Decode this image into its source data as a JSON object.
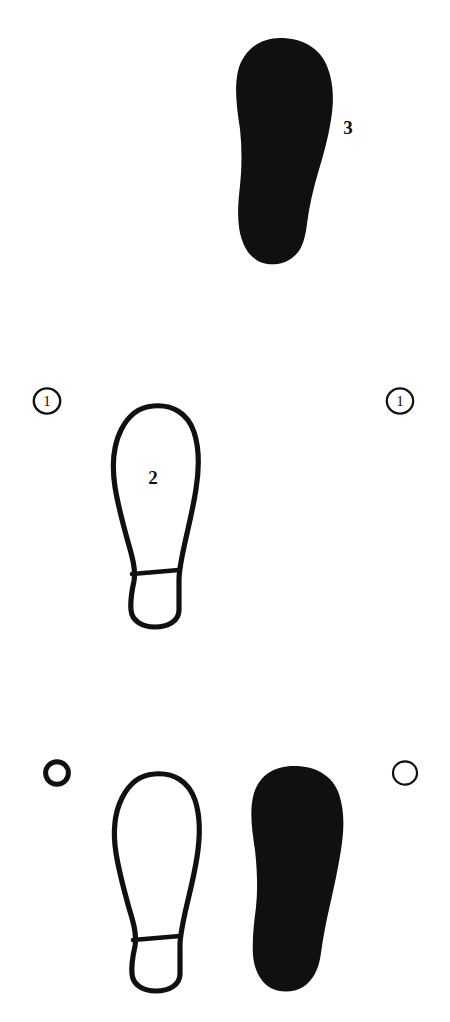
{
  "figure": {
    "background_color": "#ffffff",
    "ink_color": "#101010",
    "width": 450,
    "height": 1022
  },
  "rows": [
    {
      "id": "row-top",
      "left_marker": null,
      "right_marker": null,
      "prints": [
        {
          "id": "print-filled-top",
          "style": "filled",
          "label": "3",
          "label_position": "outside-right"
        }
      ]
    },
    {
      "id": "row-middle",
      "left_marker": {
        "type": "circled-number",
        "label": "1"
      },
      "right_marker": {
        "type": "circled-number",
        "label": "1"
      },
      "prints": [
        {
          "id": "print-outline-middle",
          "style": "outline",
          "label": "2",
          "label_position": "inside"
        }
      ]
    },
    {
      "id": "row-bottom",
      "left_marker": {
        "type": "circle-thick",
        "label": ""
      },
      "right_marker": {
        "type": "circle-thin",
        "label": ""
      },
      "prints": [
        {
          "id": "print-outline-bottom",
          "style": "outline",
          "label": "",
          "label_position": "inside"
        },
        {
          "id": "print-filled-bottom",
          "style": "filled",
          "label": "",
          "label_position": "inside"
        }
      ]
    }
  ],
  "labels": {
    "top_filled_number": "3",
    "middle_outline_number": "2",
    "middle_left_circle_number": "1",
    "middle_right_circle_number": "1"
  }
}
